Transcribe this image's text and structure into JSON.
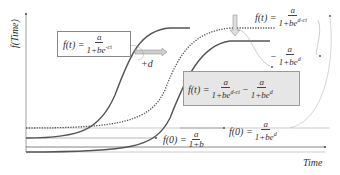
{
  "axes": {
    "y_label": "f(Time)",
    "x_label": "Time"
  },
  "formulas": {
    "base": {
      "lhs": "f(t) =",
      "num": "a",
      "den_prefix": "1+be",
      "den_exp": "-ct"
    },
    "shift_label": "+d",
    "shifted": {
      "lhs": "f(t) =",
      "num": "a",
      "den_prefix": "1+be",
      "den_exp": "d-ct"
    },
    "offset": {
      "lhs": "−",
      "num": "a",
      "den_prefix": "1+be",
      "den_exp": "d"
    },
    "combined": {
      "lhs": "f(t) =",
      "num1": "a",
      "den1_prefix": "1+be",
      "den1_exp": "d-ct",
      "minus": "−",
      "num2": "a",
      "den2_prefix": "1+be",
      "den2_exp": "d"
    },
    "initial_base": {
      "lhs": "f(0) =",
      "num": "a",
      "den": "1+b"
    },
    "initial_shifted": {
      "lhs": "f(0) =",
      "num": "a",
      "den_prefix": "1+be",
      "den_exp": "d"
    }
  },
  "colors": {
    "curve": "#555555",
    "axis": "#888888",
    "box_fill": "#e6e6e6",
    "arrow_fill": "#cccccc"
  }
}
